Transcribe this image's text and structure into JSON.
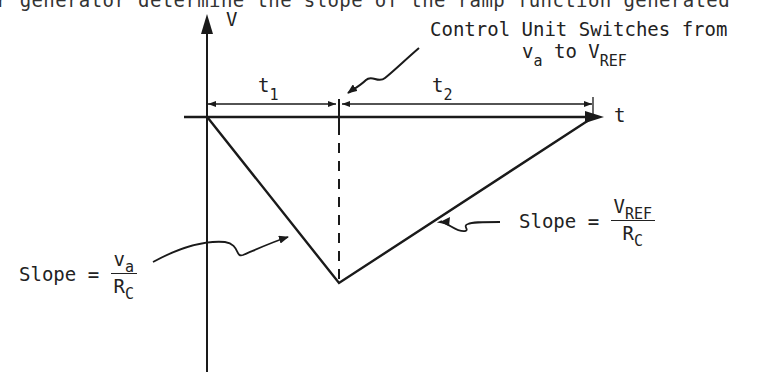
{
  "header_text": "r generator determine the slope of the ramp function generated",
  "axes": {
    "y_label": "V",
    "x_label": "t"
  },
  "intervals": {
    "t1": {
      "base": "t",
      "sub": "1"
    },
    "t2": {
      "base": "t",
      "sub": "2"
    }
  },
  "annotation_switch": {
    "line1": "Control Unit Switches from",
    "line2_a_base": "v",
    "line2_a_sub": "a",
    "line2_mid": "to",
    "line2_b_base": "V",
    "line2_b_sub": "REF"
  },
  "slope_left": {
    "prefix": "Slope =",
    "num_base": "v",
    "num_sub": "a",
    "den_base": "R",
    "den_sub": "C"
  },
  "slope_right": {
    "prefix": "Slope =",
    "num_base": "V",
    "num_sub": "REF",
    "den_base": "R",
    "den_sub": "C"
  },
  "colors": {
    "line": "#1a1a1a",
    "background": "#ffffff"
  }
}
